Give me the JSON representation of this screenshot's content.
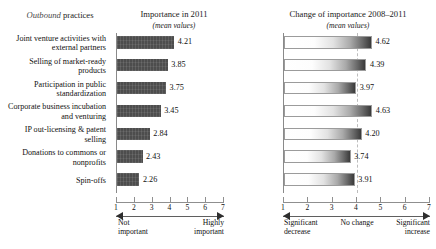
{
  "headers": {
    "left_emph": "Outbound",
    "left_rest": " practices",
    "middle_title": "Importance in 2011",
    "middle_sub": "(mean values)",
    "right_title": "Change of importance 2008–2011",
    "right_sub": "(mean values)"
  },
  "axis": {
    "ticks": [
      "1",
      "2",
      "3",
      "4",
      "5",
      "6",
      "7"
    ],
    "left_low": "Not\nimportant",
    "left_low_l1": "Not",
    "left_low_l2": "important",
    "left_high_l1": "Highly",
    "left_high_l2": "important",
    "right_low_l1": "Significant",
    "right_low_l2": "decrease",
    "right_mid": "No change",
    "right_high_l1": "Significant",
    "right_high_l2": "increase"
  },
  "chart_data": {
    "type": "bar",
    "title": "Outbound practices",
    "orientation": "horizontal",
    "grid": false,
    "legend": "none",
    "xlim": [
      1,
      7
    ],
    "reference_line": 4,
    "categories": [
      "Joint venture activities with external partners",
      "Selling of market-ready products",
      "Participation in public standardization",
      "Corporate business incubation and venturing",
      "IP out-licensing & patent selling",
      "Donations to commons or nonprofits",
      "Spin-offs"
    ],
    "category_lines": [
      [
        "Joint venture activities with",
        "external partners"
      ],
      [
        "Selling of market-ready",
        "products"
      ],
      [
        "Participation in public",
        "standardization"
      ],
      [
        "Corporate business incubation",
        "and venturing"
      ],
      [
        "IP out-licensing & patent",
        "selling"
      ],
      [
        "Donations to commons or",
        "nonprofits"
      ],
      [
        "Spin-offs",
        ""
      ]
    ],
    "series": [
      {
        "name": "Importance in 2011",
        "xlabel": "Not important – Highly important",
        "ylabel": "",
        "values": [
          4.21,
          3.85,
          3.75,
          3.45,
          2.84,
          2.43,
          2.26
        ],
        "labels": [
          "4.21",
          "3.85",
          "3.75",
          "3.45",
          "2.84",
          "2.43",
          "2.26"
        ],
        "style": "solid-dark",
        "color": "#4d4d4d"
      },
      {
        "name": "Change of importance 2008–2011",
        "xlabel": "Significant decrease – No change – Significant increase",
        "ylabel": "",
        "values": [
          4.62,
          4.39,
          3.97,
          4.63,
          4.2,
          3.74,
          3.91
        ],
        "labels": [
          "4.62",
          "4.39",
          "3.97",
          "4.63",
          "4.20",
          "3.74",
          "3.91"
        ],
        "style": "gradient-white-to-dark",
        "color": "#3a3a3a"
      }
    ]
  }
}
